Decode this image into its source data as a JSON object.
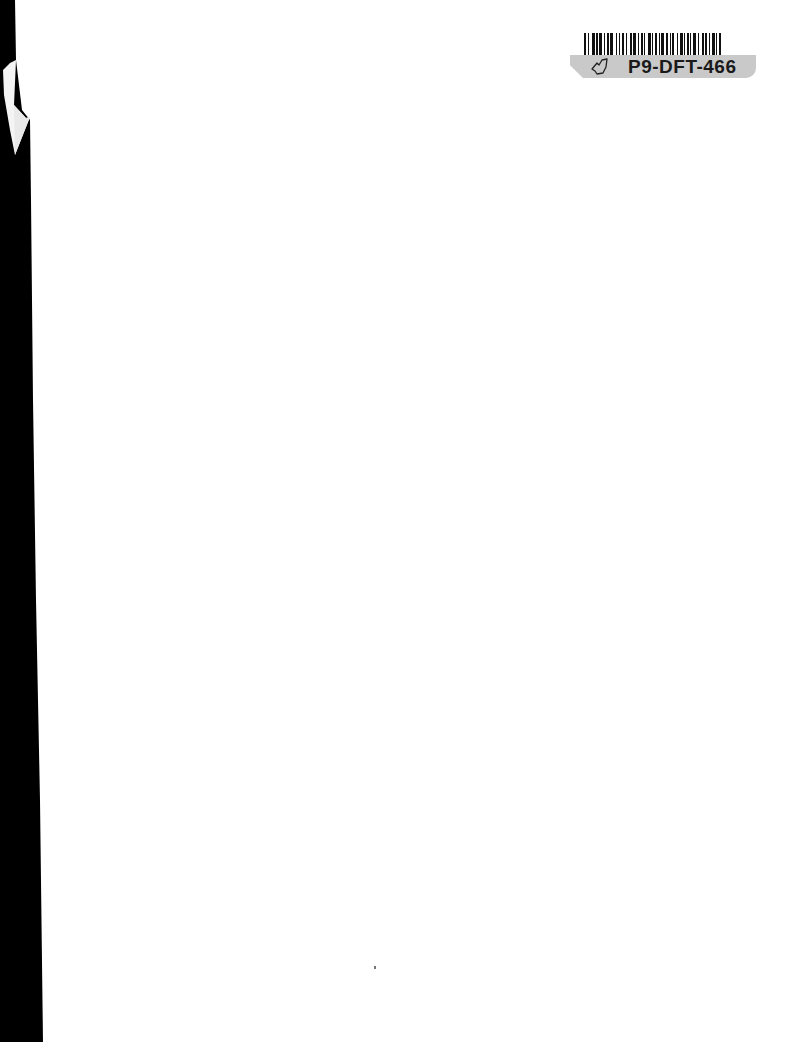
{
  "document": {
    "type": "scanned blank page",
    "barcode_label": {
      "code": "P9-DFT-466",
      "icon": "hand-drawn-leaf-icon"
    }
  },
  "colors": {
    "page": "#ffffff",
    "scan_edge": "#000000",
    "label_plate": "#c9c9c9",
    "barcode_ink": "#111111"
  }
}
